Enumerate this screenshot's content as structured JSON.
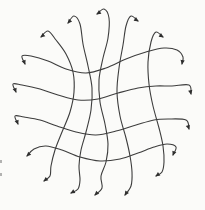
{
  "figure": {
    "viewbox": "0 0 205 210",
    "width": 205,
    "height": 210,
    "background_color": "#fbfbf9",
    "stroke_color": "#3d3d3d",
    "arrow_color": "#2e2e2e",
    "artifact_color": "#8a8a8a",
    "stroke_width": 1.1,
    "arrowheads": "both-ends"
  },
  "curves": [
    {
      "name": "vertical-curve-1",
      "points": [
        [
          41,
          37
        ],
        [
          48,
          31
        ],
        [
          56,
          40
        ],
        [
          66,
          54
        ],
        [
          73,
          72
        ],
        [
          74,
          92
        ],
        [
          70,
          112
        ],
        [
          62,
          132
        ],
        [
          55,
          150
        ],
        [
          51,
          166
        ],
        [
          50,
          176
        ],
        [
          44,
          181
        ]
      ]
    },
    {
      "name": "vertical-curve-2",
      "points": [
        [
          68,
          23
        ],
        [
          74,
          16
        ],
        [
          80,
          24
        ],
        [
          83,
          44
        ],
        [
          88,
          66
        ],
        [
          92,
          88
        ],
        [
          91,
          110
        ],
        [
          86,
          132
        ],
        [
          81,
          150
        ],
        [
          79,
          166
        ],
        [
          80,
          180
        ],
        [
          78,
          189
        ],
        [
          71,
          193
        ]
      ]
    },
    {
      "name": "vertical-curve-3",
      "points": [
        [
          97,
          14
        ],
        [
          104,
          9
        ],
        [
          109,
          18
        ],
        [
          108,
          38
        ],
        [
          103,
          58
        ],
        [
          99,
          80
        ],
        [
          100,
          102
        ],
        [
          105,
          124
        ],
        [
          108,
          144
        ],
        [
          106,
          162
        ],
        [
          101,
          176
        ],
        [
          102,
          188
        ],
        [
          95,
          195
        ]
      ]
    },
    {
      "name": "vertical-curve-4",
      "points": [
        [
          138,
          21
        ],
        [
          131,
          16
        ],
        [
          126,
          26
        ],
        [
          123,
          45
        ],
        [
          119,
          68
        ],
        [
          117,
          92
        ],
        [
          120,
          116
        ],
        [
          126,
          138
        ],
        [
          130,
          156
        ],
        [
          132,
          172
        ],
        [
          131,
          186
        ],
        [
          125,
          195
        ]
      ]
    },
    {
      "name": "vertical-curve-5",
      "points": [
        [
          163,
          37
        ],
        [
          156,
          32
        ],
        [
          151,
          42
        ],
        [
          148,
          62
        ],
        [
          149,
          84
        ],
        [
          153,
          106
        ],
        [
          159,
          128
        ],
        [
          163,
          146
        ],
        [
          164,
          162
        ],
        [
          162,
          172
        ],
        [
          156,
          176
        ]
      ]
    },
    {
      "name": "horizontal-curve-1",
      "points": [
        [
          25,
          64
        ],
        [
          22,
          56
        ],
        [
          31,
          56
        ],
        [
          48,
          61
        ],
        [
          66,
          69
        ],
        [
          86,
          73
        ],
        [
          106,
          68
        ],
        [
          126,
          59
        ],
        [
          146,
          52
        ],
        [
          164,
          48
        ],
        [
          177,
          50
        ],
        [
          183,
          57
        ],
        [
          182,
          64
        ]
      ]
    },
    {
      "name": "horizontal-curve-2",
      "points": [
        [
          16,
          92
        ],
        [
          13,
          84
        ],
        [
          22,
          85
        ],
        [
          40,
          89
        ],
        [
          58,
          95
        ],
        [
          78,
          100
        ],
        [
          98,
          99
        ],
        [
          118,
          93
        ],
        [
          138,
          88
        ],
        [
          156,
          86
        ],
        [
          172,
          86
        ],
        [
          189,
          85
        ],
        [
          191,
          94
        ]
      ]
    },
    {
      "name": "horizontal-curve-3",
      "points": [
        [
          18,
          124
        ],
        [
          15,
          116
        ],
        [
          24,
          117
        ],
        [
          40,
          120
        ],
        [
          57,
          126
        ],
        [
          76,
          132
        ],
        [
          96,
          135
        ],
        [
          116,
          131
        ],
        [
          136,
          125
        ],
        [
          154,
          120
        ],
        [
          168,
          119
        ],
        [
          186,
          120
        ],
        [
          189,
          129
        ]
      ]
    },
    {
      "name": "horizontal-curve-4",
      "points": [
        [
          27,
          156
        ],
        [
          34,
          149
        ],
        [
          46,
          146
        ],
        [
          62,
          150
        ],
        [
          80,
          157
        ],
        [
          100,
          161
        ],
        [
          120,
          159
        ],
        [
          138,
          153
        ],
        [
          154,
          147
        ],
        [
          167,
          144
        ],
        [
          176,
          147
        ],
        [
          173,
          155
        ]
      ]
    }
  ],
  "edge_artifacts": [
    {
      "name": "page-edge-mark-1",
      "x": 0,
      "y": 160,
      "width": 2,
      "height": 3
    },
    {
      "name": "page-edge-mark-2",
      "x": 0,
      "y": 173,
      "width": 2,
      "height": 3
    }
  ]
}
